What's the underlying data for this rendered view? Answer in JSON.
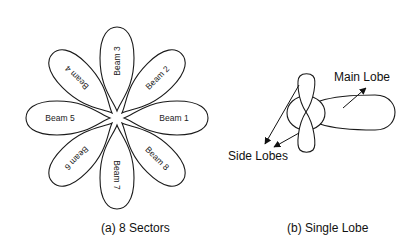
{
  "figure_a": {
    "caption": "(a) 8 Sectors",
    "center": [
      117,
      118
    ],
    "beams": [
      {
        "label": "Beam 1",
        "angle": 0
      },
      {
        "label": "Beam 2",
        "angle": -45
      },
      {
        "label": "Beam 3",
        "angle": -90
      },
      {
        "label": "Beam 4",
        "angle": -135
      },
      {
        "label": "Beam 5",
        "angle": 180
      },
      {
        "label": "Beam 6",
        "angle": 135
      },
      {
        "label": "Beam 7",
        "angle": 90
      },
      {
        "label": "Beam 8",
        "angle": 45
      }
    ]
  },
  "figure_b": {
    "caption": "(b) Single Lobe",
    "main_lobe_label": "Main Lobe",
    "side_lobes_label": "Side Lobes"
  },
  "colors": {
    "stroke": "#1a1a1a",
    "background": "#ffffff"
  }
}
